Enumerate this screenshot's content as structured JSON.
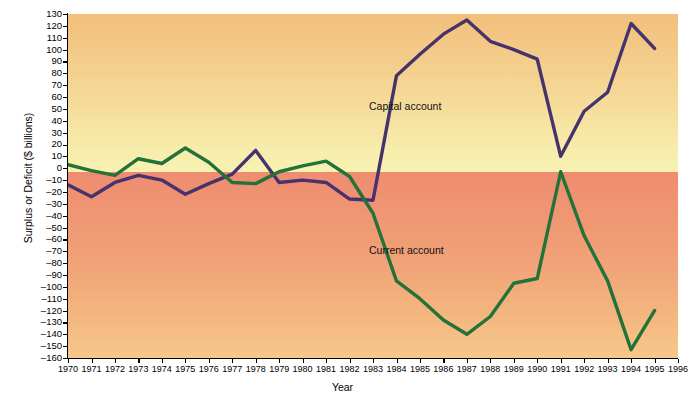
{
  "chart_data": {
    "type": "line",
    "title": "",
    "xlabel": "Year",
    "ylabel": "Surplus or Deficit ($ billions)",
    "xlim": [
      1970,
      1996
    ],
    "ylim": [
      -160,
      130
    ],
    "ytick_step": 10,
    "grid": false,
    "legend_position": "inline-annotation",
    "x": [
      1970,
      1971,
      1972,
      1973,
      1974,
      1975,
      1976,
      1977,
      1978,
      1979,
      1980,
      1981,
      1982,
      1983,
      1984,
      1985,
      1986,
      1987,
      1988,
      1989,
      1990,
      1991,
      1992,
      1993,
      1994,
      1995
    ],
    "xtick_labels": [
      "1970",
      "1971",
      "1972",
      "1973",
      "1974",
      "1975",
      "1976",
      "1977",
      "1978",
      "1979",
      "1980",
      "1981",
      "1982",
      "1983",
      "1984",
      "1985",
      "1986",
      "1987",
      "1988",
      "1989",
      "1990",
      "1991",
      "1992",
      "1993",
      "1994",
      "1995",
      "1996"
    ],
    "ytick_labels": [
      "130",
      "120",
      "110",
      "100",
      "90",
      "80",
      "70",
      "60",
      "50",
      "40",
      "30",
      "20",
      "10",
      "0",
      "-10",
      "-20",
      "-30",
      "-40",
      "-50",
      "-60",
      "-70",
      "-80",
      "-90",
      "-100",
      "-110",
      "-120",
      "-130",
      "-140",
      "-150",
      "-160"
    ],
    "series": [
      {
        "name": "Capital account",
        "color": "#46336e",
        "values": [
          -14,
          -24,
          -12,
          -6,
          -10,
          -22,
          -13,
          -5,
          15,
          -12,
          -10,
          -12,
          -26,
          -27,
          78,
          96,
          113,
          125,
          107,
          100,
          92,
          10,
          48,
          64,
          122,
          101
        ]
      },
      {
        "name": "Current account",
        "color": "#237238",
        "values": [
          3,
          -2,
          -6,
          8,
          4,
          17,
          5,
          -12,
          -13,
          -3,
          2,
          6,
          -7,
          -38,
          -95,
          -110,
          -128,
          -140,
          -125,
          -97,
          -93,
          -3,
          -57,
          -95,
          -153,
          -120
        ]
      }
    ],
    "annotations": [
      {
        "text": "Capital account",
        "series": "Capital account"
      },
      {
        "text": "Current account",
        "series": "Current account"
      }
    ],
    "background": {
      "top_gradient": [
        "#f2bf7c",
        "#f8f2b2"
      ],
      "bottom_gradient": [
        "#ef8c70",
        "#f6c88c"
      ],
      "zero_split": 0
    }
  }
}
